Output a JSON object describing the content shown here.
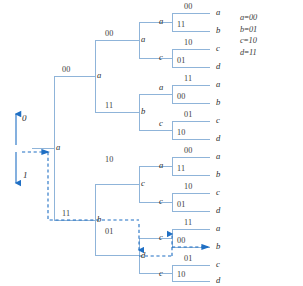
{
  "diagram": {
    "colors": {
      "branch": "#8fb4d9",
      "highlight": "#1f6fc4",
      "text": "#333333"
    },
    "input_arrows": [
      {
        "name": "input-0",
        "label": "0",
        "direction": "up"
      },
      {
        "name": "input-1",
        "label": "1",
        "direction": "down"
      }
    ],
    "root": {
      "label": "a"
    },
    "level1": [
      {
        "bits": "00",
        "node": "a"
      },
      {
        "bits": "11",
        "node": "b"
      }
    ],
    "level2": [
      {
        "bits": "00",
        "node": "a"
      },
      {
        "bits": "11",
        "node": "b"
      },
      {
        "bits": "10",
        "node": "c"
      },
      {
        "bits": "01",
        "node": "d"
      }
    ],
    "level3": [
      {
        "bits": "00",
        "node": "a"
      },
      {
        "bits": "11",
        "node": "b"
      },
      {
        "bits": "10",
        "node": "c"
      },
      {
        "bits": "01",
        "node": "d"
      },
      {
        "bits": "11",
        "node": "a"
      },
      {
        "bits": "00",
        "node": "b"
      },
      {
        "bits": "01",
        "node": "c"
      },
      {
        "bits": "10",
        "node": "d"
      },
      {
        "bits": "11",
        "node": "a"
      },
      {
        "bits": "00",
        "node": "b"
      },
      {
        "bits": "10",
        "node": "c"
      },
      {
        "bits": "01",
        "node": "d"
      },
      {
        "bits": "01",
        "node": "c"
      },
      {
        "bits": "00",
        "node": "b"
      },
      {
        "bits": "01",
        "node": "c"
      },
      {
        "bits": "10",
        "node": "d"
      }
    ],
    "leaves": [
      {
        "bits": "00",
        "label": "a"
      },
      {
        "bits": "11",
        "label": "b"
      },
      {
        "bits": "10",
        "label": "c"
      },
      {
        "bits": "01",
        "label": "d"
      },
      {
        "bits": "11",
        "label": "a"
      },
      {
        "bits": "00",
        "label": "b"
      },
      {
        "bits": "01",
        "label": "c"
      },
      {
        "bits": "10",
        "label": "d"
      },
      {
        "bits": "00",
        "label": "a"
      },
      {
        "bits": "11",
        "label": "b"
      },
      {
        "bits": "10",
        "label": "c"
      },
      {
        "bits": "01",
        "label": "d"
      },
      {
        "bits": "11",
        "label": "a"
      },
      {
        "bits": "00",
        "label": "b"
      },
      {
        "bits": "01",
        "label": "c"
      },
      {
        "bits": "10",
        "label": "d"
      }
    ],
    "legend": [
      {
        "state": "a",
        "code": "00"
      },
      {
        "state": "b",
        "code": "01"
      },
      {
        "state": "c",
        "code": "10"
      },
      {
        "state": "d",
        "code": "11"
      }
    ]
  }
}
